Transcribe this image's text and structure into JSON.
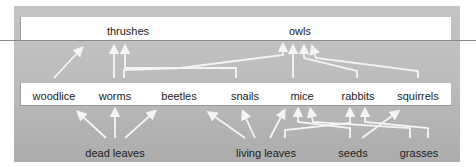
{
  "diagram": {
    "type": "food-web",
    "top_level": [
      {
        "id": "thrushes",
        "label": "thrushes",
        "x": 128,
        "y": 25
      },
      {
        "id": "owls",
        "label": "owls",
        "x": 300,
        "y": 25
      }
    ],
    "middle_level": [
      {
        "id": "woodlice",
        "label": "woodlice",
        "x": 54,
        "y": 90
      },
      {
        "id": "worms",
        "label": "worms",
        "x": 115,
        "y": 90
      },
      {
        "id": "beetles",
        "label": "beetles",
        "x": 179,
        "y": 90
      },
      {
        "id": "snails",
        "label": "snails",
        "x": 245,
        "y": 90
      },
      {
        "id": "mice",
        "label": "mice",
        "x": 302,
        "y": 90
      },
      {
        "id": "rabbits",
        "label": "rabbits",
        "x": 358,
        "y": 90
      },
      {
        "id": "squirrels",
        "label": "squirrels",
        "x": 418,
        "y": 90
      }
    ],
    "bottom_level": [
      {
        "id": "dead_leaves",
        "label": "dead leaves",
        "x": 115,
        "y": 147
      },
      {
        "id": "living_leaves",
        "label": "living leaves",
        "x": 266,
        "y": 147
      },
      {
        "id": "seeds",
        "label": "seeds",
        "x": 353,
        "y": 147
      },
      {
        "id": "grasses",
        "label": "grasses",
        "x": 419,
        "y": 147
      }
    ],
    "links": [
      {
        "from": "woodlice",
        "to": "thrushes"
      },
      {
        "from": "worms",
        "to": "thrushes"
      },
      {
        "from": "snails",
        "to": "thrushes"
      },
      {
        "from": "beetles",
        "to": "owls"
      },
      {
        "from": "mice",
        "to": "owls"
      },
      {
        "from": "rabbits",
        "to": "owls"
      },
      {
        "from": "squirrels",
        "to": "owls"
      },
      {
        "from": "dead_leaves",
        "to": "woodlice"
      },
      {
        "from": "dead_leaves",
        "to": "worms"
      },
      {
        "from": "dead_leaves",
        "to": "beetles"
      },
      {
        "from": "living_leaves",
        "to": "snails"
      },
      {
        "from": "living_leaves",
        "to": "mice"
      },
      {
        "from": "living_leaves",
        "to": "rabbits"
      },
      {
        "from": "seeds",
        "to": "mice"
      },
      {
        "from": "seeds",
        "to": "squirrels"
      },
      {
        "from": "grasses",
        "to": "rabbits"
      },
      {
        "from": "grasses",
        "to": "mice"
      }
    ]
  }
}
